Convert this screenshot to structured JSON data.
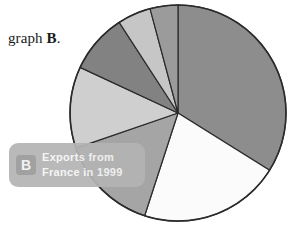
{
  "page": {
    "background_color": "#ffffff",
    "width": 296,
    "height": 235
  },
  "body_text": {
    "prefix": "graph ",
    "emphasis": "B",
    "suffix": "."
  },
  "caption": {
    "badge_letter": "B",
    "line1": "Exports from",
    "line2": "France in 1999",
    "pill_color": "#b4b4b4",
    "badge_color": "#9a9a9a",
    "text_color": "#f4f4f4"
  },
  "chart_data": {
    "type": "pie",
    "title": "Exports from France in 1999",
    "xlabel": "",
    "ylabel": "",
    "legend_position": "none",
    "grid": false,
    "center": {
      "x": 178,
      "y": 113
    },
    "radius": 108,
    "start_angle_deg": 0,
    "direction": "clockwise",
    "outline_color": "#2b2b2b",
    "categories": [
      "slice-1",
      "slice-2",
      "slice-3",
      "slice-4",
      "slice-5",
      "slice-6",
      "slice-7"
    ],
    "values": [
      34,
      21,
      15,
      12,
      9,
      5,
      4
    ],
    "slices": [
      {
        "name": "slice-1",
        "start_deg": 0,
        "end_deg": 122,
        "value": 34,
        "color": "#8d8d8d"
      },
      {
        "name": "slice-2",
        "start_deg": 122,
        "end_deg": 198,
        "value": 21,
        "color": "#fbfbfb"
      },
      {
        "name": "slice-3",
        "start_deg": 198,
        "end_deg": 251,
        "value": 15,
        "color": "#a5a5a5"
      },
      {
        "name": "slice-4",
        "start_deg": 251,
        "end_deg": 295,
        "value": 12,
        "color": "#cfcfcf"
      },
      {
        "name": "slice-5",
        "start_deg": 295,
        "end_deg": 327,
        "value": 9,
        "color": "#828282"
      },
      {
        "name": "slice-6",
        "start_deg": 327,
        "end_deg": 345,
        "value": 5,
        "color": "#c6c6c6"
      },
      {
        "name": "slice-7",
        "start_deg": 345,
        "end_deg": 360,
        "value": 4,
        "color": "#9b9b9b"
      }
    ]
  }
}
